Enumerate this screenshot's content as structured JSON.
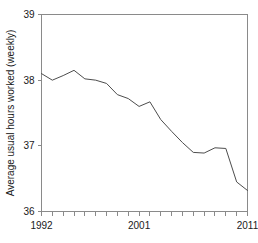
{
  "chart_data": {
    "type": "line",
    "title": "",
    "subtitle": "",
    "xlabel": "",
    "ylabel": "Average usual hours worked (weekly)",
    "xlim": [
      1992,
      2011
    ],
    "ylim": [
      36,
      39
    ],
    "grid": false,
    "legend": false,
    "x": [
      1992,
      1993,
      1994,
      1995,
      1996,
      1997,
      1998,
      1999,
      2000,
      2001,
      2002,
      2003,
      2004,
      2005,
      2006,
      2007,
      2008,
      2009,
      2010,
      2011
    ],
    "series": [
      {
        "name": "Average usual hours worked (weekly)",
        "color": "#4d4d4d",
        "values": [
          38.1,
          38.0,
          38.07,
          38.15,
          38.02,
          38.0,
          37.95,
          37.78,
          37.72,
          37.6,
          37.67,
          37.4,
          37.22,
          37.05,
          36.9,
          36.89,
          36.97,
          36.96,
          36.45,
          36.32
        ]
      }
    ],
    "y_ticks": [
      36,
      37,
      38,
      39
    ],
    "y_tick_labels": [
      "36",
      "37",
      "38",
      "39"
    ],
    "x_ticks": [
      1992,
      1993,
      1994,
      1995,
      1996,
      1997,
      1998,
      1999,
      2000,
      2001,
      2002,
      2003,
      2004,
      2005,
      2006,
      2007,
      2008,
      2009,
      2010,
      2011
    ],
    "x_tick_labels_shown": [
      {
        "value": 1992,
        "label": "1992"
      },
      {
        "value": 2001,
        "label": "2001"
      },
      {
        "value": 2011,
        "label": "2011"
      }
    ],
    "axis_color": "#8a8a8a",
    "text_color": "#1a1a1a",
    "background": "#ffffff"
  }
}
